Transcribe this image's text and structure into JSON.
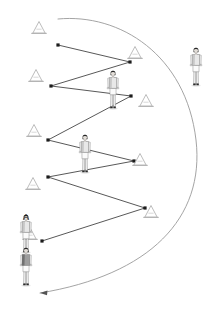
{
  "diagram": {
    "type": "sports-drill-diagram",
    "canvas": {
      "width": 220,
      "height": 311,
      "background": "#ffffff"
    },
    "colors": {
      "line": "#3a3a3a",
      "cone_outline": "#b9b9b9",
      "curve": "#9a9a9a",
      "label_text": "#111111",
      "player_dark": "#2b2b2b",
      "player_light": "#f2f2f2",
      "player_mid": "#9c9c9c"
    },
    "labels": [
      {
        "id": "start-cone-label",
        "text": "A",
        "x": 26,
        "y": 219
      }
    ],
    "cones": [
      {
        "id": "cone-1",
        "x": 39,
        "y": 28
      },
      {
        "id": "cone-2",
        "x": 135,
        "y": 53
      },
      {
        "id": "cone-3",
        "x": 36,
        "y": 76
      },
      {
        "id": "cone-4",
        "x": 146,
        "y": 101
      },
      {
        "id": "cone-5",
        "x": 34,
        "y": 131
      },
      {
        "id": "cone-6",
        "x": 140,
        "y": 160
      },
      {
        "id": "cone-7",
        "x": 33,
        "y": 184
      },
      {
        "id": "cone-8",
        "x": 151,
        "y": 212
      },
      {
        "id": "cone-9",
        "x": 30,
        "y": 234
      }
    ],
    "players": [
      {
        "id": "player-1",
        "x": 113,
        "y": 70,
        "height": 38,
        "facing": "front"
      },
      {
        "id": "player-2",
        "x": 196,
        "y": 45,
        "height": 40,
        "facing": "front"
      },
      {
        "id": "player-3",
        "x": 85,
        "y": 134,
        "height": 38,
        "facing": "front"
      },
      {
        "id": "player-4",
        "x": 26,
        "y": 216,
        "height": 36,
        "facing": "front"
      },
      {
        "id": "player-5",
        "x": 26,
        "y": 247,
        "height": 38,
        "facing": "front"
      }
    ],
    "zigzag_path": {
      "stroke": "#3a3a3a",
      "points": [
        {
          "x": 58,
          "y": 45
        },
        {
          "x": 130,
          "y": 62
        },
        {
          "x": 51,
          "y": 86
        },
        {
          "x": 131,
          "y": 96
        },
        {
          "x": 48,
          "y": 140
        },
        {
          "x": 134,
          "y": 161
        },
        {
          "x": 48,
          "y": 177
        },
        {
          "x": 145,
          "y": 208
        },
        {
          "x": 42,
          "y": 241
        }
      ],
      "node_markers": [
        {
          "x": 58,
          "y": 45
        },
        {
          "x": 130,
          "y": 62
        },
        {
          "x": 51,
          "y": 86
        },
        {
          "x": 131,
          "y": 96
        },
        {
          "x": 48,
          "y": 140
        },
        {
          "x": 134,
          "y": 161
        },
        {
          "x": 48,
          "y": 177
        },
        {
          "x": 145,
          "y": 208
        },
        {
          "x": 42,
          "y": 241
        }
      ]
    },
    "return_curve": {
      "stroke": "#9a9a9a",
      "description": "Curved return run from the top of the course around the right side and back to the start",
      "start": {
        "x": 58,
        "y": 19
      },
      "end": {
        "x": 26,
        "y": 294
      },
      "arrowhead_at": "end"
    }
  }
}
